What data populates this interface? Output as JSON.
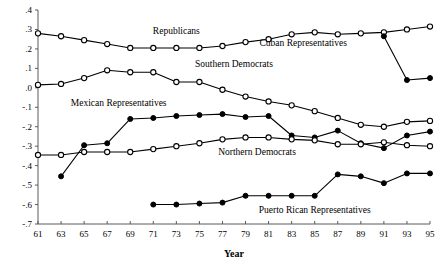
{
  "chart_data": {
    "type": "line",
    "title": "",
    "xlabel": "Year",
    "ylabel": "",
    "xlim": [
      61,
      95
    ],
    "ylim": [
      -0.7,
      0.4
    ],
    "grid": false,
    "legend": "inline-annotations",
    "x": [
      61,
      63,
      65,
      67,
      69,
      71,
      73,
      75,
      77,
      79,
      81,
      83,
      85,
      87,
      89,
      91,
      93,
      95
    ],
    "xtick_labels": [
      "61",
      "63",
      "65",
      "67",
      "69",
      "71",
      "73",
      "75",
      "77",
      "79",
      "81",
      "83",
      "85",
      "87",
      "89",
      "91",
      "93",
      "95"
    ],
    "ytick_labels": [
      ".4",
      ".3",
      ".2",
      ".1",
      ".0",
      "-.1",
      "-.2",
      "-.3",
      "-.4",
      "-.5",
      "-.6",
      "-.7"
    ],
    "ytick_values": [
      0.4,
      0.3,
      0.2,
      0.1,
      0.0,
      -0.1,
      -0.2,
      -0.3,
      -0.4,
      -0.5,
      -0.6,
      -0.7
    ],
    "series": [
      {
        "name": "Republicans",
        "marker": "open-circle",
        "label_x": 73,
        "label_y": 0.275,
        "x": [
          61,
          63,
          65,
          67,
          69,
          71,
          73,
          75,
          77,
          79,
          81,
          83,
          85,
          87,
          89,
          91,
          93,
          95
        ],
        "values": [
          0.28,
          0.265,
          0.245,
          0.225,
          0.205,
          0.205,
          0.205,
          0.205,
          0.215,
          0.235,
          0.25,
          0.275,
          0.285,
          0.275,
          0.28,
          0.285,
          0.3,
          0.315
        ]
      },
      {
        "name": "Southern Democrats",
        "marker": "open-circle",
        "label_x": 78,
        "label_y": 0.105,
        "x": [
          61,
          63,
          65,
          67,
          69,
          71,
          73,
          75,
          77,
          79,
          81,
          83,
          85,
          87,
          89,
          91,
          93,
          95
        ],
        "values": [
          0.015,
          0.02,
          0.05,
          0.09,
          0.08,
          0.08,
          0.03,
          0.03,
          -0.01,
          -0.045,
          -0.07,
          -0.09,
          -0.12,
          -0.155,
          -0.19,
          -0.2,
          -0.175,
          -0.17
        ]
      },
      {
        "name": "Mexican Representatives",
        "marker": "closed-circle",
        "label_x": 68,
        "label_y": -0.095,
        "x": [
          63,
          65,
          67,
          69,
          71,
          73,
          75,
          77,
          79,
          81,
          83,
          85,
          87,
          89,
          91,
          93,
          95
        ],
        "values": [
          -0.455,
          -0.295,
          -0.285,
          -0.16,
          -0.155,
          -0.145,
          -0.14,
          -0.135,
          -0.15,
          -0.145,
          -0.245,
          -0.255,
          -0.22,
          -0.285,
          -0.31,
          -0.245,
          -0.225
        ]
      },
      {
        "name": "Northern Democrats",
        "marker": "open-circle",
        "label_x": 80,
        "label_y": -0.345,
        "x": [
          61,
          63,
          65,
          67,
          69,
          71,
          73,
          75,
          77,
          79,
          81,
          83,
          85,
          87,
          89,
          91,
          93,
          95
        ],
        "values": [
          -0.345,
          -0.345,
          -0.33,
          -0.33,
          -0.33,
          -0.315,
          -0.3,
          -0.285,
          -0.265,
          -0.255,
          -0.255,
          -0.265,
          -0.27,
          -0.29,
          -0.29,
          -0.28,
          -0.295,
          -0.3
        ]
      },
      {
        "name": "Puerto Rican Representatives",
        "marker": "closed-circle",
        "label_x": 85,
        "label_y": -0.645,
        "x": [
          71,
          73,
          75,
          77,
          79,
          81,
          83,
          85,
          87,
          89,
          91,
          93,
          95
        ],
        "values": [
          -0.6,
          -0.6,
          -0.595,
          -0.59,
          -0.555,
          -0.555,
          -0.555,
          -0.555,
          -0.445,
          -0.455,
          -0.49,
          -0.44,
          -0.44
        ]
      },
      {
        "name": "Cuban Representatives",
        "marker": "closed-circle",
        "label_x": 84,
        "label_y": 0.215,
        "x": [
          91,
          93,
          95
        ],
        "values": [
          0.265,
          0.04,
          0.05
        ]
      }
    ]
  }
}
